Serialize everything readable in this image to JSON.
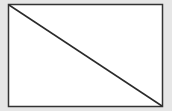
{
  "canvas": {
    "width": 172,
    "height": 111,
    "background": "#e6e6e6"
  },
  "diagram": {
    "shape": "rectangle-with-diagonal",
    "rect": {
      "x": 8.5,
      "y": 4.5,
      "width": 154,
      "height": 102,
      "fill": "#ffffff",
      "stroke": "#333333",
      "stroke_width": 1.5
    },
    "diagonal": {
      "x1": 9,
      "y1": 5,
      "x2": 162,
      "y2": 106,
      "stroke": "#2a2a2a",
      "stroke_width": 1.5
    }
  }
}
